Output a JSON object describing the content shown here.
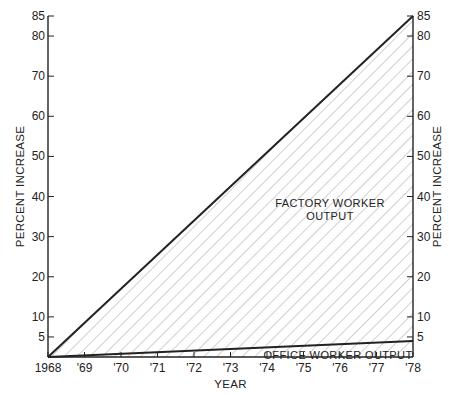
{
  "chart_data": {
    "type": "area",
    "title": "",
    "xlabel": "YEAR",
    "ylabel_left": "PERCENT INCREASE",
    "ylabel_right": "PERCENT INCREASE",
    "x_ticks": [
      "1968",
      "'69",
      "'70",
      "'71",
      "'72",
      "'73",
      "'74",
      "'75",
      "'76",
      "'77",
      "'78"
    ],
    "x": [
      1968,
      1978
    ],
    "y_ticks": [
      5,
      10,
      20,
      30,
      40,
      50,
      60,
      70,
      80,
      85
    ],
    "ylim": [
      0,
      85
    ],
    "series": [
      {
        "name": "FACTORY WORKER OUTPUT",
        "x": [
          1968,
          1978
        ],
        "values": [
          0,
          85
        ]
      },
      {
        "name": "OFFICE WORKER OUTPUT",
        "x": [
          1968,
          1978
        ],
        "values": [
          0,
          4
        ]
      }
    ],
    "annotations": [
      {
        "text_line1": "FACTORY WORKER",
        "text_line2": "OUTPUT"
      },
      {
        "text": "OFFICE WORKER OUTPUT"
      }
    ],
    "fill": "diagonal hatching",
    "grid": false,
    "legend": "none (inline labels)"
  },
  "colors": {
    "ink": "#222222",
    "hatch": "#888888",
    "background": "#ffffff"
  }
}
